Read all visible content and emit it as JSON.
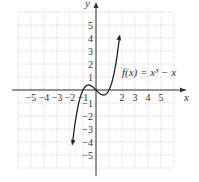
{
  "chart_data": {
    "type": "line",
    "title": "",
    "function_label": "f(x) = x³ − x",
    "xlabel": "x",
    "ylabel": "y",
    "xlim": [
      -6,
      6
    ],
    "ylim": [
      -6,
      6
    ],
    "grid": true,
    "x_ticks": [
      "-5",
      "-4",
      "-3",
      "-2",
      "-1",
      "2",
      "3",
      "4",
      "5"
    ],
    "y_ticks": [
      "5",
      "4",
      "3",
      "2",
      "1",
      "-1",
      "-2",
      "-3",
      "-4",
      "-5"
    ],
    "series": [
      {
        "name": "f(x) = x^3 - x",
        "x": [
          -1.8,
          -1.5,
          -1.0,
          -0.577,
          0,
          0.577,
          1.0,
          1.5,
          1.8
        ],
        "y": [
          -4.03,
          -1.88,
          0,
          0.385,
          0,
          -0.385,
          0,
          1.88,
          4.03
        ]
      }
    ]
  },
  "labels": {
    "x_axis": "x",
    "y_axis": "y",
    "function": "f(x) = x³ − x"
  }
}
